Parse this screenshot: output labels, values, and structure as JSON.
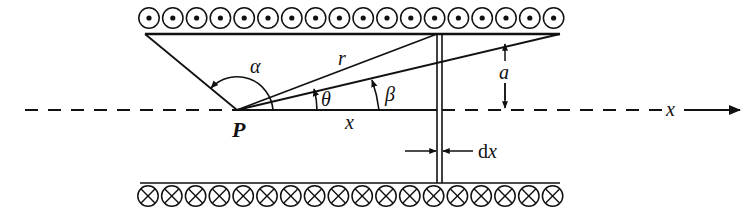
{
  "diagram": {
    "type": "solenoid-field-geometry",
    "labels": {
      "point": "P",
      "alpha": "α",
      "r": "r",
      "theta": "θ",
      "beta": "β",
      "a": "a",
      "x_segment": "x",
      "x_axis": "x",
      "dx_prefix": "d",
      "dx_var": "x"
    },
    "wires": {
      "top_row": {
        "count": 18,
        "symbol": "dot-out-of-page"
      },
      "bottom_row": {
        "count": 18,
        "symbol": "cross-into-page"
      }
    },
    "colors": {
      "ink": "#111111",
      "background": "#ffffff"
    }
  }
}
